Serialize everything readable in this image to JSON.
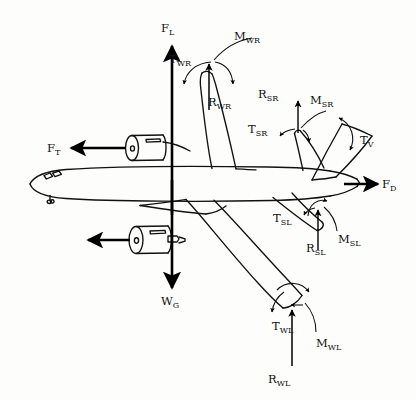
{
  "figure": {
    "view": "three-quarter perspective from above-front",
    "background_color": "#fdfdfc",
    "line_color": "#111111",
    "arrow_color": "#000000"
  },
  "labels": {
    "lift": {
      "base": "F",
      "sub": "L",
      "meaning": "lift force",
      "direction": "up"
    },
    "thrust": {
      "base": "F",
      "sub": "T",
      "meaning": "thrust force",
      "direction": "left"
    },
    "drag": {
      "base": "F",
      "sub": "D",
      "meaning": "drag force",
      "direction": "right"
    },
    "weight": {
      "base": "W",
      "sub": "G",
      "meaning": "gross weight",
      "direction": "down"
    },
    "torque_wing_right": {
      "base": "T",
      "sub": "WR",
      "meaning": "torque wing right",
      "direction": "curved"
    },
    "moment_wing_right": {
      "base": "M",
      "sub": "WR",
      "meaning": "moment wing right",
      "direction": "curved"
    },
    "reaction_wing_right": {
      "base": "R",
      "sub": "WR",
      "meaning": "reaction wing right",
      "direction": "up"
    },
    "torque_wing_left": {
      "base": "T",
      "sub": "WL",
      "meaning": "torque wing left",
      "direction": "curved"
    },
    "moment_wing_left": {
      "base": "M",
      "sub": "WL",
      "meaning": "moment wing left",
      "direction": "curved"
    },
    "reaction_wing_left": {
      "base": "R",
      "sub": "WL",
      "meaning": "reaction wing left",
      "direction": "up"
    },
    "torque_stab_right": {
      "base": "T",
      "sub": "SR",
      "meaning": "torque stabilizer right",
      "direction": "curved"
    },
    "moment_stab_right": {
      "base": "M",
      "sub": "SR",
      "meaning": "moment stabilizer right",
      "direction": "curved"
    },
    "reaction_stab_right": {
      "base": "R",
      "sub": "SR",
      "meaning": "reaction stabilizer right",
      "direction": "up"
    },
    "torque_stab_left": {
      "base": "T",
      "sub": "SL",
      "meaning": "torque stabilizer left",
      "direction": "curved"
    },
    "moment_stab_left": {
      "base": "M",
      "sub": "SL",
      "meaning": "moment stabilizer left",
      "direction": "curved"
    },
    "reaction_stab_left": {
      "base": "R",
      "sub": "SL",
      "meaning": "reaction stabilizer left",
      "direction": "up"
    },
    "torque_vertical": {
      "base": "T",
      "sub": "V",
      "meaning": "torque vertical fin",
      "direction": "curved"
    }
  }
}
